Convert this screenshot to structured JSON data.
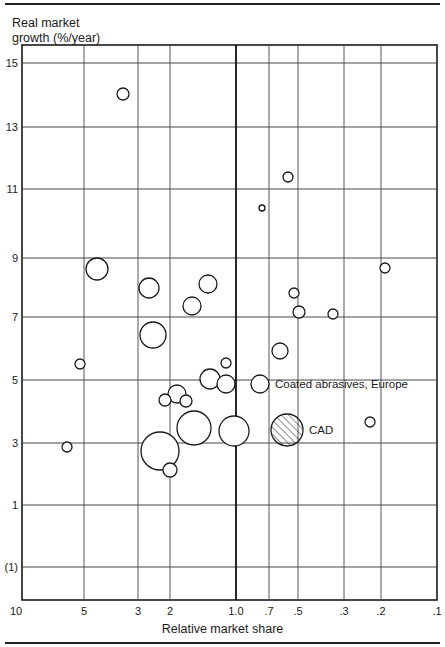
{
  "chart_data": {
    "type": "scatter",
    "subtype": "bubble",
    "title": "",
    "ylabel": "Real market growth (%/year)",
    "xlabel": "Relative market share",
    "x_scale": "log",
    "x_reversed": true,
    "xlim": [
      10,
      0.1
    ],
    "ylim": [
      -2,
      15.5
    ],
    "x_ticks": [
      "10",
      "5",
      "3",
      "2",
      "1.0",
      ".7",
      ".5",
      ".3",
      ".2",
      ".1"
    ],
    "x_tick_values": [
      10,
      5,
      3,
      2,
      1.0,
      0.7,
      0.5,
      0.3,
      0.2,
      0.1
    ],
    "y_ticks": [
      "15",
      "13",
      "11",
      "9",
      "7",
      "5",
      "3",
      "1",
      "(1)"
    ],
    "y_tick_values": [
      15,
      13,
      11,
      9,
      7,
      5,
      3,
      1,
      -1
    ],
    "grid": true,
    "divider_at_x": 1.0,
    "annotations": [
      {
        "text": "Coated abrasives, Europe",
        "x": 0.7,
        "y": 4.8
      },
      {
        "text": "CAD",
        "x": 0.56,
        "y": 3.3
      }
    ],
    "points": [
      {
        "share": 4.3,
        "growth": 14.0,
        "size": 6
      },
      {
        "share": 0.55,
        "growth": 11.4,
        "size": 5
      },
      {
        "share": 0.75,
        "growth": 10.4,
        "size": 3
      },
      {
        "share": 4.4,
        "growth": 8.6,
        "size": 11
      },
      {
        "share": 2.7,
        "growth": 8.0,
        "size": 10
      },
      {
        "share": 1.4,
        "growth": 8.1,
        "size": 9
      },
      {
        "share": 1.6,
        "growth": 7.4,
        "size": 9
      },
      {
        "share": 2.7,
        "growth": 6.4,
        "size": 13
      },
      {
        "share": 0.19,
        "growth": 8.6,
        "size": 5
      },
      {
        "share": 0.52,
        "growth": 7.7,
        "size": 5
      },
      {
        "share": 0.5,
        "growth": 7.1,
        "size": 6
      },
      {
        "share": 0.33,
        "growth": 7.0,
        "size": 5
      },
      {
        "share": 0.6,
        "growth": 5.9,
        "size": 8
      },
      {
        "share": 5.3,
        "growth": 5.4,
        "size": 5
      },
      {
        "share": 1.1,
        "growth": 5.5,
        "size": 5
      },
      {
        "share": 1.35,
        "growth": 5.0,
        "size": 10
      },
      {
        "share": 1.1,
        "growth": 4.8,
        "size": 9
      },
      {
        "share": 0.7,
        "growth": 4.8,
        "size": 9,
        "label": "Coated abrasives, Europe"
      },
      {
        "share": 1.9,
        "growth": 4.5,
        "size": 9
      },
      {
        "share": 2.1,
        "growth": 4.3,
        "size": 6
      },
      {
        "share": 1.8,
        "growth": 4.3,
        "size": 6
      },
      {
        "share": 1.7,
        "growth": 3.4,
        "size": 17
      },
      {
        "share": 1.0,
        "growth": 3.3,
        "size": 15
      },
      {
        "share": 0.56,
        "growth": 3.3,
        "size": 16,
        "label": "CAD",
        "hatched": true
      },
      {
        "share": 0.23,
        "growth": 3.6,
        "size": 5
      },
      {
        "share": 2.3,
        "growth": 2.7,
        "size": 19
      },
      {
        "share": 2.0,
        "growth": 2.1,
        "size": 7
      },
      {
        "share": 6.0,
        "growth": 2.8,
        "size": 5
      }
    ]
  },
  "labels": {
    "ylabel_line1": "Real market",
    "ylabel_line2": "growth (%/year)",
    "xlabel": "Relative market share"
  },
  "layout": {
    "plot": {
      "left": 22,
      "right": 437,
      "top": 45,
      "bottom": 600
    },
    "x_tick_px": [
      22,
      84,
      138,
      170,
      236,
      269,
      298,
      344,
      381,
      437
    ],
    "y_tick_px": [
      63,
      127,
      189,
      258,
      317,
      380,
      443,
      505,
      567
    ],
    "bubbles_px": [
      [
        123,
        94,
        6
      ],
      [
        288,
        177,
        5
      ],
      [
        262,
        208,
        3
      ],
      [
        97,
        269,
        11
      ],
      [
        149,
        288,
        10
      ],
      [
        208,
        284,
        9
      ],
      [
        192,
        306,
        9
      ],
      [
        153,
        335,
        13
      ],
      [
        385,
        268,
        5
      ],
      [
        294,
        293,
        5
      ],
      [
        299,
        312,
        6
      ],
      [
        333,
        314,
        5
      ],
      [
        280,
        351,
        8
      ],
      [
        80,
        364,
        5
      ],
      [
        226,
        363,
        5
      ],
      [
        210,
        379,
        10
      ],
      [
        226,
        384,
        9
      ],
      [
        260,
        384,
        9
      ],
      [
        177,
        394,
        9
      ],
      [
        165,
        400,
        6
      ],
      [
        186,
        401,
        6
      ],
      [
        194,
        428,
        17
      ],
      [
        234,
        431,
        15
      ],
      [
        287,
        430,
        16
      ],
      [
        370,
        422,
        5
      ],
      [
        160,
        451,
        19
      ],
      [
        170,
        470,
        7
      ],
      [
        67,
        447,
        5
      ]
    ]
  }
}
